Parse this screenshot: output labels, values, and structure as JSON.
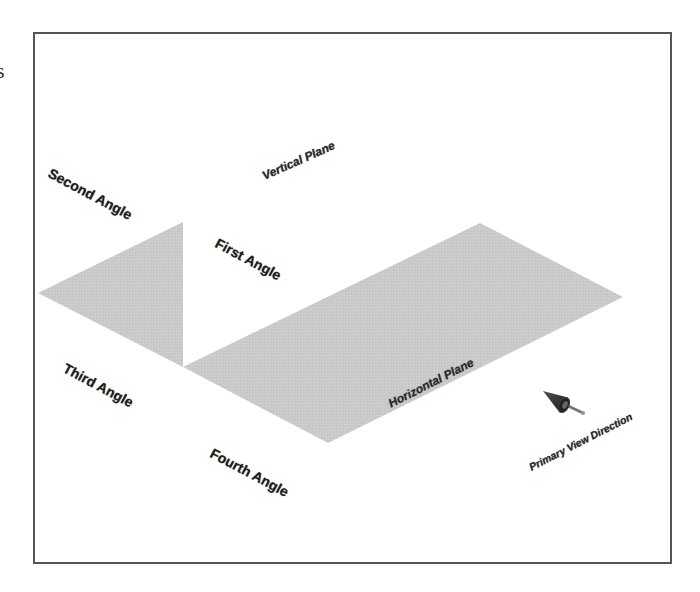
{
  "page": {
    "fragment_text": "s"
  },
  "diagram": {
    "title": "",
    "colors": {
      "plane_fill": "#cbcbcb",
      "frame_border": "#555555",
      "label_text": "#1e1e1e",
      "arrow": "#2a2a2a"
    },
    "planes": {
      "vertical_plane_label": "Vertical Plane",
      "horizontal_plane_label": "Horizontal Plane"
    },
    "quadrants": {
      "first": "First Angle",
      "second": "Second Angle",
      "third": "Third Angle",
      "fourth": "Fourth Angle"
    },
    "view": {
      "direction_label": "Primary View Direction",
      "arrow_icon": "view-direction-arrow-icon"
    }
  }
}
